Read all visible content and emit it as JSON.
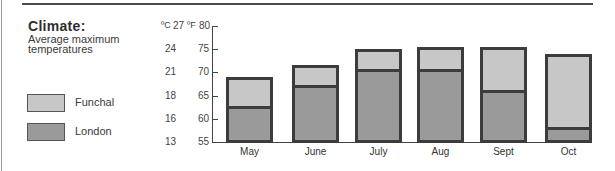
{
  "title": "Climate:",
  "subtitle": "Average maximum temperatures",
  "legend": [
    {
      "label": "Funchal",
      "pattern": "light",
      "color": "#d4d4d4"
    },
    {
      "label": "London",
      "pattern": "dark",
      "color": "#a8a8a8"
    }
  ],
  "axis": {
    "unit_c": "ºC",
    "unit_f": "ºF",
    "celsius_ticks": [
      "27",
      "24",
      "21",
      "18",
      "16",
      "13"
    ],
    "fahrenheit_ticks": [
      "80",
      "75",
      "70",
      "65",
      "60",
      "55"
    ]
  },
  "chart_data": {
    "type": "bar",
    "xlabel": "",
    "ylabel": "Temperature (ºC / ºF)",
    "ylim": [
      55,
      80
    ],
    "yticks_f": [
      55,
      60,
      65,
      70,
      75,
      80
    ],
    "yticks_c": [
      13,
      16,
      18,
      21,
      24,
      27
    ],
    "grid": false,
    "legend_position": "left",
    "categories": [
      "May",
      "June",
      "July",
      "Aug",
      "Sept",
      "Oct"
    ],
    "series": [
      {
        "name": "Funchal",
        "values": [
          69,
          71.5,
          75,
          75.5,
          75.5,
          74
        ]
      },
      {
        "name": "London",
        "values": [
          62.5,
          67,
          70.5,
          70.5,
          66,
          58
        ]
      }
    ]
  }
}
